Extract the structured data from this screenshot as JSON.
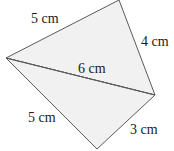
{
  "diagram": {
    "type": "quadrilateral-split-into-two-triangles",
    "fill_color": "#f1f1f1",
    "stroke_color": "#5a5a5a",
    "text_color": "#1a1a1a",
    "vertices": {
      "left": [
        6,
        58
      ],
      "top": [
        119,
        0
      ],
      "right": [
        155,
        95
      ],
      "bottom": [
        97,
        149
      ]
    },
    "triangles": [
      {
        "name": "upper-triangle",
        "sides": [
          "5 cm",
          "4 cm",
          "6 cm"
        ]
      },
      {
        "name": "lower-triangle",
        "sides": [
          "6 cm",
          "3 cm",
          "5 cm"
        ]
      }
    ],
    "labels": {
      "top_left_side": "5 cm",
      "top_right_side": "4 cm",
      "diagonal": "6 cm",
      "bottom_left_side": "5 cm",
      "bottom_right_side": "3 cm"
    }
  }
}
